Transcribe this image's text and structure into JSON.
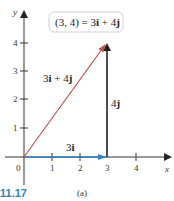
{
  "figure": {
    "number": "11.17",
    "subfigure": "(a)",
    "number_color": "#2f7fc1"
  },
  "axes": {
    "x_label": "x",
    "y_label": "y",
    "x_ticks": [
      "1",
      "2",
      "3",
      "4"
    ],
    "y_ticks": [
      "1",
      "2",
      "3",
      "4"
    ],
    "origin_label": "0",
    "axis_color": "#333333"
  },
  "vectors": [
    {
      "name": "3i + 4j",
      "from": [
        0,
        0
      ],
      "to": [
        3,
        4
      ],
      "color": "#c0504d",
      "label": "3i + 4j"
    },
    {
      "name": "3i",
      "from": [
        0,
        0
      ],
      "to": [
        3,
        0
      ],
      "color": "#2f7fc1",
      "label": "3i"
    },
    {
      "name": "4j",
      "from": [
        3,
        0
      ],
      "to": [
        3,
        4
      ],
      "color": "#222222",
      "label": "4j"
    }
  ],
  "callout": {
    "text_left": "(3, 4) = 3",
    "i": "i",
    "plus": " + 4",
    "j": "j"
  },
  "labels": {
    "diag_coef1": "3",
    "diag_i": "i",
    "diag_plus": " + 4",
    "diag_j": "j",
    "horiz_coef": "3",
    "horiz_i": "i",
    "vert_coef": "4",
    "vert_j": "j"
  }
}
